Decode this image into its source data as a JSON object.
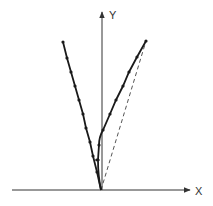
{
  "diagram": {
    "axes": {
      "x_label": "X",
      "y_label": "Y"
    },
    "colors": {
      "line": "#1a1a1a",
      "axis": "#333333",
      "dashed": "#555555",
      "background": "#ffffff"
    },
    "left_path": {
      "points": [
        [
          63,
          42
        ],
        [
          67,
          58
        ],
        [
          71,
          72
        ],
        [
          75,
          86
        ],
        [
          79,
          100
        ],
        [
          83,
          114
        ],
        [
          86,
          128
        ],
        [
          90,
          142
        ],
        [
          93,
          156
        ],
        [
          97,
          172
        ],
        [
          101,
          190
        ]
      ]
    },
    "right_path": {
      "points": [
        [
          146,
          41
        ],
        [
          137,
          57
        ],
        [
          129,
          72
        ],
        [
          123,
          86
        ],
        [
          116,
          100
        ],
        [
          110,
          114
        ],
        [
          103,
          130
        ],
        [
          99,
          145
        ],
        [
          98,
          160
        ],
        [
          99,
          175
        ],
        [
          101,
          190
        ]
      ]
    },
    "dashed_line": {
      "from": [
        101,
        190
      ],
      "to": [
        146,
        41
      ]
    }
  }
}
